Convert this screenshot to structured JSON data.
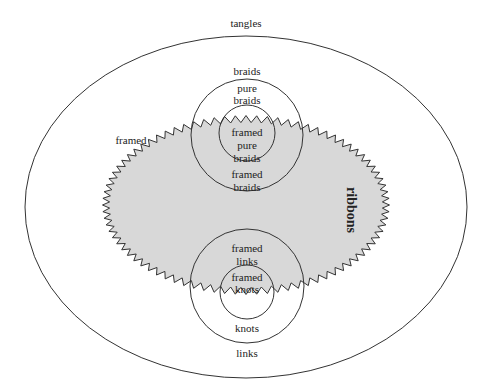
{
  "diagram": {
    "type": "nested-set-venn",
    "colors": {
      "stroke": "#333333",
      "ribbons_fill": "#d8d8d8",
      "background": "#ffffff"
    },
    "regions": {
      "tangles": {
        "label": "tangles"
      },
      "ribbons": {
        "label": "ribbons"
      },
      "framed": {
        "label": "framed"
      },
      "braids": {
        "label": "braids"
      },
      "pure_braids": {
        "line1": "pure",
        "line2": "braids"
      },
      "framed_pure_braids": {
        "line1": "framed",
        "line2": "pure",
        "line3": "braids"
      },
      "framed_braids": {
        "line1": "framed",
        "line2": "braids"
      },
      "framed_links": {
        "line1": "framed",
        "line2": "links"
      },
      "framed_knots": {
        "line1": "framed",
        "line2": "knots"
      },
      "knots": {
        "label": "knots"
      },
      "links": {
        "label": "links"
      }
    }
  }
}
